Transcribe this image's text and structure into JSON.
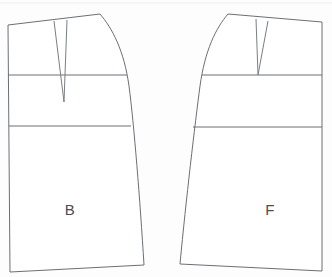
{
  "document": {
    "title": "Skirt Block Pattern Draft",
    "type": "technical-line-drawing",
    "background_color": "#fdfdfd",
    "line_color": "#6b6f75",
    "label_color": "#4a4e54"
  },
  "panels": [
    {
      "id": "back",
      "label": "B",
      "label_x": 70,
      "label_y": 211,
      "description": "Back skirt panel",
      "outline_path": "M 8,25 L 100,14 C 112,28 124,50 129,86 C 134,124 140,200 144,265 L 10,272 Z",
      "hip_line": {
        "x1": 8,
        "y1": 75,
        "x2": 127,
        "y2": 75
      },
      "hem_guide_line": {
        "x1": 9,
        "y1": 126,
        "x2": 131,
        "y2": 126
      },
      "dart": {
        "left_leg": {
          "x1": 54,
          "y1": 21,
          "x2": 64,
          "y2": 102
        },
        "right_leg": {
          "x1": 67,
          "y1": 20,
          "x2": 64,
          "y2": 102
        },
        "apex_x": 64,
        "apex_y": 102
      }
    },
    {
      "id": "front",
      "label": "F",
      "label_x": 270,
      "label_y": 211,
      "description": "Front skirt panel",
      "outline_path": "M 322,22 L 228,14 C 216,28 205,50 200,86 C 195,124 186,200 180,264 L 322,271 Z",
      "hip_line": {
        "x1": 202,
        "y1": 75,
        "x2": 322,
        "y2": 75
      },
      "hem_guide_line": {
        "x1": 193,
        "y1": 127,
        "x2": 322,
        "y2": 127
      },
      "dart": {
        "left_leg": {
          "x1": 256,
          "y1": 19,
          "x2": 258,
          "y2": 75
        },
        "right_leg": {
          "x1": 268,
          "y1": 21,
          "x2": 258,
          "y2": 75
        },
        "apex_x": 258,
        "apex_y": 75
      }
    }
  ],
  "artifacts": {
    "top_scan_line": {
      "x1": 0,
      "y1": 3,
      "x2": 332,
      "y2": 3
    }
  },
  "chart_data": {
    "type": "diagram",
    "categories": [
      "B",
      "F"
    ],
    "series": [
      {
        "name": "Back panel",
        "label": "B"
      },
      {
        "name": "Front panel",
        "label": "F"
      }
    ],
    "xlabel": "",
    "ylabel": "",
    "grid": false,
    "legend": "none"
  }
}
